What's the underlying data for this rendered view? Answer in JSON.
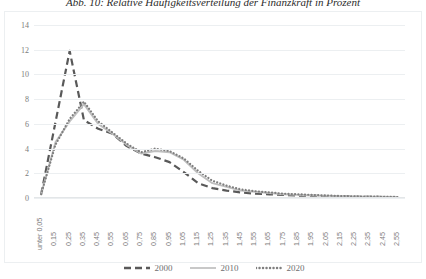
{
  "figure": {
    "title": "Abb. 10: Relative Häufigkeitsverteilung der Finanzkraft in Prozent"
  },
  "legend": {
    "position": "bottom",
    "items": [
      {
        "label": "2000",
        "style": "dashed",
        "color": "#595959"
      },
      {
        "label": "2010",
        "style": "solid",
        "color": "#bfbfbf"
      },
      {
        "label": "2020",
        "style": "dotted",
        "color": "#7f7f7f"
      }
    ]
  },
  "chart_data": {
    "type": "line",
    "title": "Abb. 10: Relative Häufigkeitsverteilung der Finanzkraft in Prozent",
    "xlabel": "",
    "ylabel": "",
    "ylim": [
      0,
      14
    ],
    "yticks": [
      0,
      2,
      4,
      6,
      8,
      10,
      12,
      14
    ],
    "grid": true,
    "categories": [
      "unter 0,05",
      "0,15",
      "0,25",
      "0,35",
      "0,45",
      "0,55",
      "0,65",
      "0,75",
      "0,85",
      "0,95",
      "1,05",
      "1,15",
      "1,25",
      "1,35",
      "1,45",
      "1,55",
      "1,65",
      "1,75",
      "1,85",
      "1,95",
      "2,05",
      "2,15",
      "2,25",
      "2,35",
      "2,45",
      "2,55"
    ],
    "series": [
      {
        "name": "2000",
        "color": "#595959",
        "style": "dashed",
        "values": [
          0.3,
          6.1,
          11.9,
          6.3,
          5.6,
          5.2,
          4.2,
          3.6,
          3.3,
          2.9,
          2.1,
          1.2,
          0.8,
          0.6,
          0.45,
          0.35,
          0.3,
          0.25,
          0.2,
          0.18,
          0.15,
          0.12,
          0.1,
          0.1,
          0.08,
          0.08
        ]
      },
      {
        "name": "2010",
        "color": "#bfbfbf",
        "style": "solid",
        "values": [
          0.3,
          4.5,
          6.2,
          7.6,
          6.0,
          5.2,
          4.3,
          3.6,
          3.8,
          3.7,
          3.1,
          2.0,
          1.2,
          0.9,
          0.6,
          0.5,
          0.4,
          0.3,
          0.25,
          0.2,
          0.18,
          0.15,
          0.12,
          0.1,
          0.1,
          0.08
        ]
      },
      {
        "name": "2020",
        "color": "#7f7f7f",
        "style": "dotted",
        "values": [
          0.3,
          4.3,
          6.4,
          7.8,
          6.2,
          5.3,
          4.4,
          3.7,
          4.0,
          3.8,
          3.2,
          2.2,
          1.4,
          1.0,
          0.7,
          0.55,
          0.45,
          0.35,
          0.3,
          0.25,
          0.2,
          0.16,
          0.13,
          0.11,
          0.1,
          0.08
        ]
      }
    ]
  }
}
